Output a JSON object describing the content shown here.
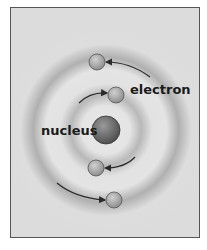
{
  "diagram": {
    "type": "atom-model",
    "labels": {
      "nucleus": "nucleus",
      "electron": "electron"
    },
    "nucleus": {
      "cx": 106,
      "cy": 130,
      "r": 14,
      "color": "#6e6e6e"
    },
    "electrons": [
      {
        "cx": 97,
        "cy": 62,
        "r": 8,
        "arrow_from": "upper-right"
      },
      {
        "cx": 116,
        "cy": 95,
        "r": 8,
        "arrow_from": "left"
      },
      {
        "cx": 96,
        "cy": 168,
        "r": 8,
        "arrow_from": "right"
      },
      {
        "cx": 114,
        "cy": 200,
        "r": 8,
        "arrow_from": "left"
      }
    ],
    "colors": {
      "background": "#dcdcdc",
      "ring": "#a8a8a8",
      "electron": "#b0b0b0",
      "arrow": "#2a2a2a",
      "border": "#555555"
    }
  }
}
